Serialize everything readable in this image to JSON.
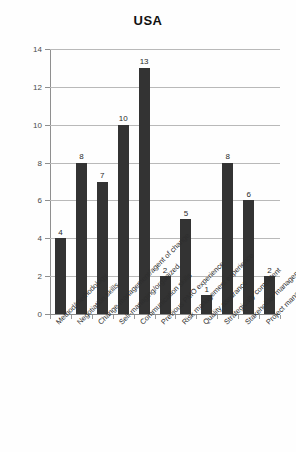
{
  "chart_data": {
    "type": "bar",
    "title": "USA",
    "xlabel": "",
    "ylabel": "",
    "ylim": [
      0,
      14
    ],
    "ytick_interval": 2,
    "yticks": [
      0,
      2,
      4,
      6,
      8,
      10,
      12,
      14
    ],
    "grid": true,
    "legend": null,
    "legend_position": "none",
    "bar_color": "#333333",
    "gridline_color": "#b9b9b9",
    "background_color": "#ffffff",
    "label_rotation_deg": -45,
    "show_data_labels": true,
    "categories": [
      "Method/methodology",
      "Negotiation skills",
      "Change management/agent of change",
      "Self-managing/organized",
      "Communication skills",
      "Previous PMO experience",
      "Risk management experience",
      "Quality assurance",
      "Strategically competent",
      "Stakeholder management skills",
      "Project management experience"
    ],
    "values": [
      4,
      8,
      7,
      10,
      13,
      2,
      5,
      1,
      8,
      6,
      2
    ]
  }
}
